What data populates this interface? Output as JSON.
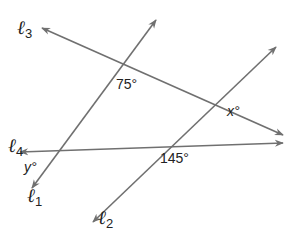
{
  "diagram": {
    "stroke_color": "#707070",
    "text_color": "#222222",
    "lines": [
      {
        "id": "l1",
        "letter": "ℓ",
        "sub": "1",
        "x1": 156,
        "y1": 20,
        "x2": 32,
        "y2": 188,
        "arrows": "both"
      },
      {
        "id": "l2",
        "letter": "ℓ",
        "sub": "2",
        "x1": 276,
        "y1": 47,
        "x2": 93,
        "y2": 222,
        "arrows": "both"
      },
      {
        "id": "l3",
        "letter": "ℓ",
        "sub": "3",
        "x1": 42,
        "y1": 28,
        "x2": 283,
        "y2": 135,
        "arrows": "both"
      },
      {
        "id": "l4",
        "letter": "ℓ",
        "sub": "4",
        "x1": 20,
        "y1": 152,
        "x2": 283,
        "y2": 143,
        "arrows": "both"
      }
    ],
    "line_labels": {
      "l3": {
        "letter": "ℓ",
        "sub": "3"
      },
      "l4": {
        "letter": "ℓ",
        "sub": "4"
      },
      "l1": {
        "letter": "ℓ",
        "sub": "1"
      },
      "l2": {
        "letter": "ℓ",
        "sub": "2"
      }
    },
    "angles": {
      "a75": {
        "value": "75°",
        "between": [
          "l1",
          "l3"
        ]
      },
      "x": {
        "value": "x°",
        "between": [
          "l2",
          "l3"
        ]
      },
      "a145": {
        "value": "145°",
        "between": [
          "l2",
          "l4"
        ]
      },
      "y": {
        "value": "y°",
        "between": [
          "l1",
          "l4"
        ]
      }
    }
  }
}
